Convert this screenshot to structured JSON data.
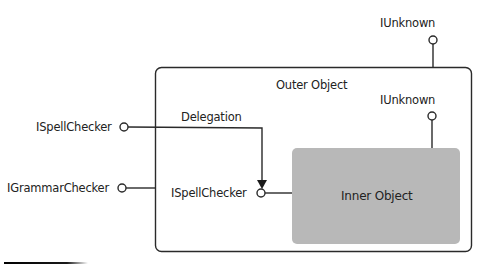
{
  "diagram": {
    "outer_object": {
      "label": "Outer Object",
      "interface_top": "IUnknown"
    },
    "inner_object": {
      "label": "Inner Object",
      "interface_top": "IUnknown",
      "interface_left": "ISpellChecker",
      "fill_color": "#b8b8b8"
    },
    "external_interfaces": [
      {
        "label": "ISpellChecker"
      },
      {
        "label": "IGrammarChecker"
      }
    ],
    "edge_label": "Delegation",
    "colors": {
      "stroke": "#2a2a2a",
      "text": "#222222",
      "inner_fill": "#b8b8b8",
      "background": "#ffffff"
    }
  }
}
